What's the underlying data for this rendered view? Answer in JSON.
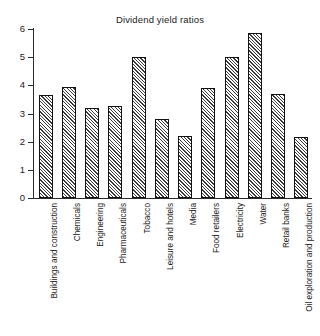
{
  "chart_data": {
    "type": "bar",
    "title": "Dividend yield ratios",
    "xlabel": "",
    "ylabel": "",
    "ylim": [
      0,
      6
    ],
    "yticks": [
      0,
      1,
      2,
      3,
      4,
      5,
      6
    ],
    "ytick_labels": [
      "0",
      "1",
      "2",
      "3",
      "4",
      "5",
      "6"
    ],
    "grid": false,
    "legend": null,
    "bar_style": {
      "fill": "diagonal-hatch",
      "edge_color": "#111111",
      "face_color": "#f2f2f2"
    },
    "categories": [
      "Buildings and construction",
      "Chemicals",
      "Engineering",
      "Pharmaceuticals",
      "Tobacco",
      "Leisure and hotels",
      "Media",
      "Food retailers",
      "Electricity",
      "Water",
      "Retail banks",
      "Oil exploration and production"
    ],
    "values": [
      3.65,
      3.95,
      3.2,
      3.25,
      5.0,
      2.8,
      2.2,
      3.9,
      5.0,
      5.85,
      3.7,
      2.15
    ]
  }
}
